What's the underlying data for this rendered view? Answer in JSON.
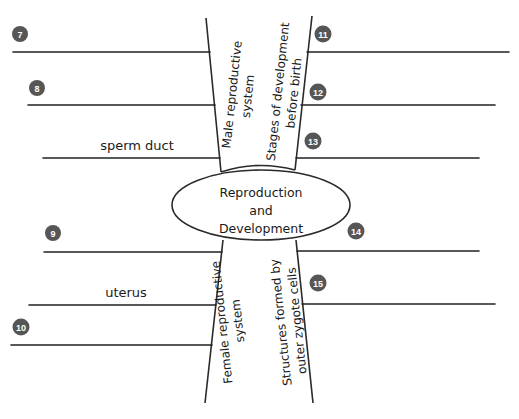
{
  "diagram": {
    "center": {
      "line1": "Reproduction",
      "line2": "and",
      "line3": "Development"
    },
    "branches": {
      "top_left": {
        "line1": "Male reproductive",
        "line2": "system"
      },
      "top_right": {
        "line1": "Stages of development",
        "line2": "before birth"
      },
      "bottom_left": {
        "line1": "Female reproductive",
        "line2": "system"
      },
      "bottom_right": {
        "line1": "Structures formed by",
        "line2": "outer zygote cells"
      }
    },
    "slots": [
      {
        "number": "7",
        "answer": ""
      },
      {
        "number": "8",
        "answer": ""
      },
      {
        "number": "",
        "answer": "sperm duct"
      },
      {
        "number": "9",
        "answer": ""
      },
      {
        "number": "",
        "answer": "uterus"
      },
      {
        "number": "10",
        "answer": ""
      },
      {
        "number": "11",
        "answer": ""
      },
      {
        "number": "12",
        "answer": ""
      },
      {
        "number": "13",
        "answer": ""
      },
      {
        "number": "14",
        "answer": ""
      },
      {
        "number": "15",
        "answer": ""
      }
    ],
    "colors": {
      "line": "#222222",
      "badge": "#565656",
      "badge_text": "#ffffff"
    }
  }
}
